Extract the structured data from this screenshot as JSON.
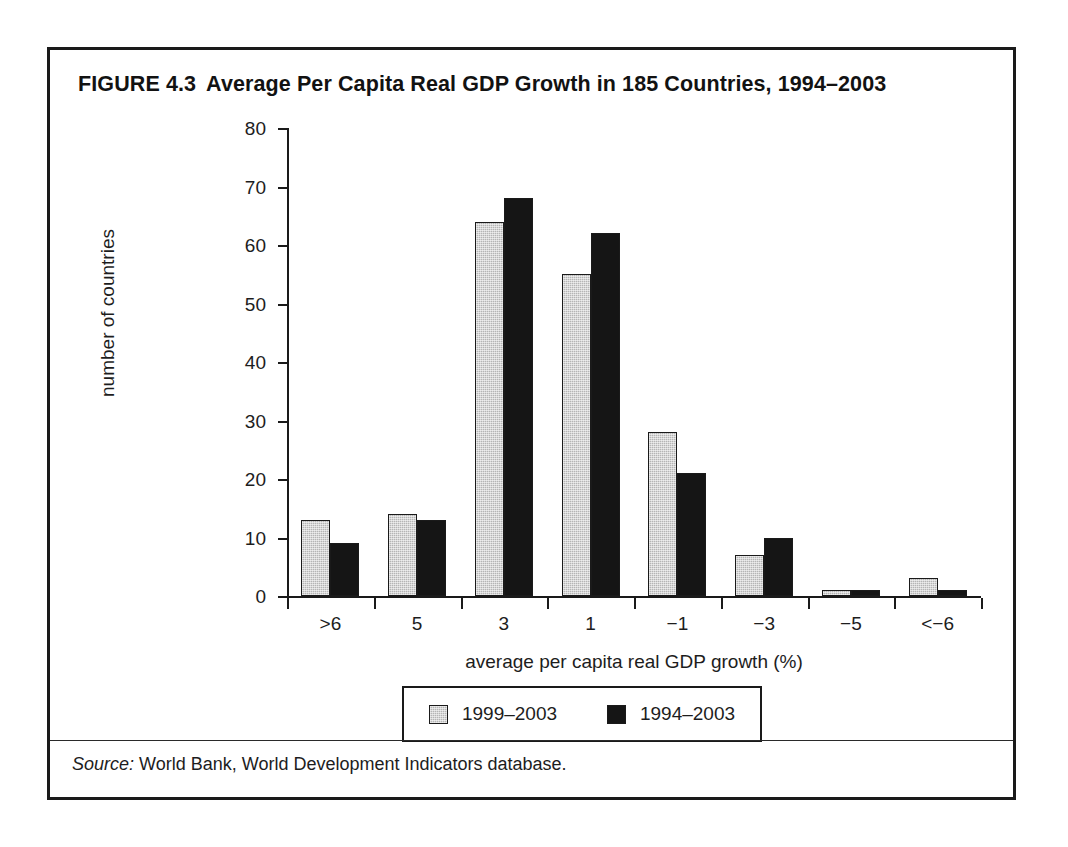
{
  "figure": {
    "number": "FIGURE 4.3",
    "title": "Average Per Capita Real GDP Growth in 185 Countries, 1994–2003",
    "source_word": "Source:",
    "source_text": " World Bank, World Development Indicators database."
  },
  "colors": {
    "series_0": "#b5b5b5",
    "series_1": "#151515",
    "frame": "#1a1a1a",
    "background": "#ffffff",
    "text": "#1d1d1d"
  },
  "chart_data": {
    "type": "bar",
    "title": "Average Per Capita Real GDP Growth in 185 Countries, 1994–2003",
    "xlabel": "average per capita real GDP growth (%)",
    "ylabel": "number of countries",
    "categories": [
      ">6",
      "5",
      "3",
      "1",
      "−1",
      "−3",
      "−5",
      "<−6"
    ],
    "series": [
      {
        "name": "1999–2003",
        "color": "#b5b5b5",
        "values": [
          13,
          14,
          64,
          55,
          28,
          7,
          1,
          3
        ]
      },
      {
        "name": "1994–2003",
        "color": "#151515",
        "values": [
          9,
          13,
          68,
          62,
          21,
          10,
          1,
          1
        ]
      }
    ],
    "ylim": [
      0,
      80
    ],
    "yticks": [
      0,
      10,
      20,
      30,
      40,
      50,
      60,
      70,
      80
    ],
    "ytick_labels": [
      "0",
      "10",
      "20",
      "30",
      "40",
      "50",
      "60",
      "70",
      "80"
    ],
    "grid": false,
    "legend_position": "bottom"
  }
}
